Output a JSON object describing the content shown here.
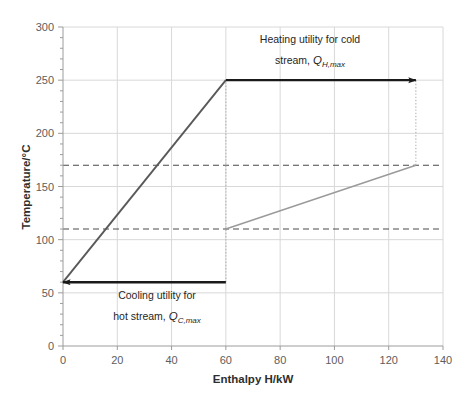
{
  "chart_data": {
    "type": "line",
    "title": "",
    "xlabel": "Enthalpy H/kW",
    "ylabel": "Temperature/°C",
    "xlim": [
      0,
      140
    ],
    "ylim": [
      0,
      300
    ],
    "xticks": [
      0,
      20,
      40,
      60,
      80,
      100,
      120,
      140
    ],
    "yticks": [
      0,
      50,
      100,
      150,
      200,
      250,
      300
    ],
    "grid": true,
    "legend": "none",
    "series": [
      {
        "name": "hot-composite-curve",
        "color": "#595959",
        "width": 1.9,
        "points": [
          [
            0,
            60
          ],
          [
            60,
            250
          ]
        ]
      },
      {
        "name": "cold-composite-curve",
        "color": "#9a9a9a",
        "width": 1.4,
        "points": [
          [
            60,
            110
          ],
          [
            130,
            170
          ]
        ]
      },
      {
        "name": "heating-utility-arrow",
        "color": "#1a1a1a",
        "width": 2.4,
        "points": [
          [
            60,
            250
          ],
          [
            130,
            250
          ]
        ],
        "arrow": "end"
      },
      {
        "name": "cooling-utility-arrow",
        "color": "#1a1a1a",
        "width": 2.4,
        "points": [
          [
            60,
            60
          ],
          [
            0,
            60
          ]
        ],
        "arrow": "end"
      }
    ],
    "dashed_horizontal_lines": [
      {
        "name": "pinch-hot-level",
        "y": 170
      },
      {
        "name": "pinch-cold-level",
        "y": 110
      }
    ],
    "dotted_vertical_lines": [
      {
        "name": "enthalpy-60-marker",
        "x": 60,
        "y0": 60,
        "y1": 250
      },
      {
        "name": "enthalpy-130-marker",
        "x": 130,
        "y0": 170,
        "y1": 250
      }
    ],
    "annotations": [
      {
        "name": "heating-utility-annotation",
        "line1": "Heating utility for cold",
        "line2_prefix": "stream, ",
        "line2_symbol": "Q",
        "line2_subscript": "H,max",
        "x": 95,
        "y": 282
      },
      {
        "name": "cooling-utility-annotation",
        "line1": "Cooling utility for",
        "line2_prefix": "hot stream, ",
        "line2_symbol": "Q",
        "line2_subscript": "C,max",
        "x": 30,
        "y": 35
      }
    ]
  },
  "axes": {
    "x_tick_labels": [
      "0",
      "20",
      "40",
      "60",
      "80",
      "100",
      "120",
      "140"
    ],
    "y_tick_labels": [
      "0",
      "50",
      "100",
      "150",
      "200",
      "250",
      "300"
    ],
    "x_axis_title": "Enthalpy H/kW",
    "y_axis_title": "Temperature/°C"
  },
  "annotations_text": {
    "heating": {
      "line1": "Heating utility for cold",
      "line2_prefix": "stream, ",
      "symbol": "Q",
      "subscript": "H,max"
    },
    "cooling": {
      "line1": "Cooling utility for",
      "line2_prefix": "hot stream, ",
      "symbol": "Q",
      "subscript": "C,max"
    }
  },
  "colors": {
    "hot_curve": "#595959",
    "cold_curve": "#9a9a9a",
    "arrow": "#1a1a1a",
    "grid": "#d8d8d8",
    "dashed": "#4a4a4a",
    "dotted": "#b4b4b4",
    "background": "#ffffff"
  }
}
